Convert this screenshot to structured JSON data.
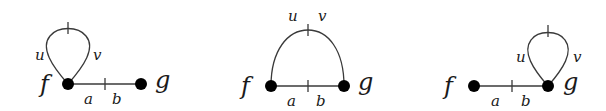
{
  "diagrams": [
    {
      "id": "left",
      "vertices": {
        "f": "f",
        "g": "g"
      },
      "edge_labels": {
        "a": "a",
        "b": "b"
      },
      "loop_labels": {
        "u": "u",
        "v": "v"
      },
      "description": "loop (u,v) attached at vertex f, edge (a,b) from f to g"
    },
    {
      "id": "middle",
      "vertices": {
        "f": "f",
        "g": "g"
      },
      "edge_labels": {
        "a": "a",
        "b": "b"
      },
      "loop_labels": {
        "u": "u",
        "v": "v"
      },
      "description": "arc (u,v) from f to g above, edge (a,b) from f to g below"
    },
    {
      "id": "right",
      "vertices": {
        "f": "f",
        "g": "g"
      },
      "edge_labels": {
        "a": "a",
        "b": "b"
      },
      "loop_labels": {
        "u": "u",
        "v": "v"
      },
      "description": "edge (a,b) from f to g, loop (u,v) attached at vertex g"
    }
  ],
  "colors": {
    "stroke": "#3a3a3a",
    "vertex": "#000000",
    "background": "#ffffff"
  }
}
